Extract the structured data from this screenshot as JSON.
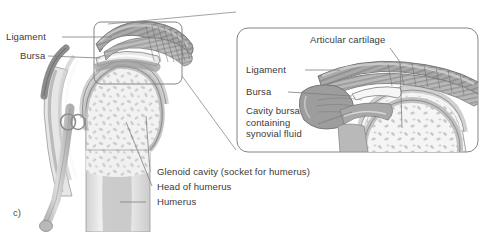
{
  "figure": {
    "id_label": "c)"
  },
  "main_labels": [
    {
      "key": "ligament",
      "text": "Ligament"
    },
    {
      "key": "bursa",
      "text": "Bursa"
    },
    {
      "key": "glenoid_cavity",
      "text": "Glenoid cavity (socket for humerus)"
    },
    {
      "key": "head_of_humerus",
      "text": "Head of humerus"
    },
    {
      "key": "humerus",
      "text": "Humerus"
    }
  ],
  "inset_labels": [
    {
      "key": "articular_cartilage",
      "text": "Articular cartilage"
    },
    {
      "key": "ligament",
      "text": "Ligament"
    },
    {
      "key": "bursa",
      "text": "Bursa"
    },
    {
      "key": "cavity_bursa",
      "text": "Cavity bursa containing synovial fluid"
    }
  ],
  "colors": {
    "outline": "#6e6e6e",
    "callout_line": "#8a8a8a",
    "text": "#3a3a3a",
    "bone_light": "#ececec",
    "bone_mid": "#d5d5d5",
    "bone_dark": "#b4b4b4",
    "cortical": "#c3c3c3",
    "ligament_dark": "#8e8e8e",
    "ligament_mid": "#a8a8a8",
    "cartilage": "#cfcfcf",
    "marrow": "#bfbfbf",
    "cavity": "#f7f7f7",
    "background": "#ffffff"
  }
}
